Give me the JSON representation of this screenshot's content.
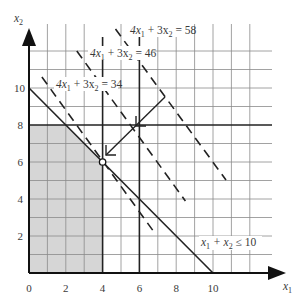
{
  "figure": {
    "type": "linear-programming-graphical-solution",
    "axes": {
      "x_label": "x",
      "x_label_sub": "1",
      "y_label": "x",
      "y_label_sub": "2",
      "x_ticks": [
        "0",
        "2",
        "4",
        "6",
        "8",
        "10"
      ],
      "y_ticks": [
        "2",
        "4",
        "6",
        "8",
        "10"
      ],
      "x_range": [
        0,
        13.2
      ],
      "y_range": [
        0,
        13.5
      ],
      "grid": true,
      "grid_step": 1
    },
    "feasible_region": {
      "vertices": [
        [
          0,
          0
        ],
        [
          0,
          8
        ],
        [
          2,
          8
        ],
        [
          4,
          6
        ],
        [
          4,
          0
        ]
      ],
      "fill": "#d6d6d6"
    },
    "constraints": [
      {
        "label": "x₁ + x₂ ≤ 10",
        "x_part": "x",
        "sub1": "1",
        "mid": " + x",
        "sub2": "2",
        "tail": " ≤ 10",
        "from": [
          0,
          10
        ],
        "to": [
          10,
          0
        ]
      },
      {
        "label": "x₁ ≤ 4",
        "from": [
          4,
          0
        ],
        "to": [
          4,
          12.8
        ]
      },
      {
        "label": "x₁ ≤ 6",
        "from": [
          6,
          0
        ],
        "to": [
          6,
          12.8
        ]
      },
      {
        "label": "x₂ ≤ 8",
        "from": [
          0,
          8
        ],
        "to": [
          13.2,
          8
        ]
      }
    ],
    "objective_lines": [
      {
        "value": 34,
        "prefix": "4x",
        "sub1": "1",
        "mid": " + 3x",
        "sub2": "2",
        "tail": " = 34",
        "from": [
          0.7,
          10.6
        ],
        "to": [
          6.8,
          2.2
        ]
      },
      {
        "value": 46,
        "prefix": "4x",
        "sub1": "1",
        "mid": " + 3x",
        "sub2": "2",
        "tail": " = 46",
        "from": [
          2.6,
          12.0
        ],
        "to": [
          8.5,
          3.9
        ]
      },
      {
        "value": 58,
        "prefix": "4x",
        "sub1": "1",
        "mid": " + 3x",
        "sub2": "2",
        "tail": " = 58",
        "from": [
          4.7,
          13.2
        ],
        "to": [
          10.7,
          5.0
        ]
      }
    ],
    "optimum": {
      "x1": 4,
      "x2": 6,
      "marker": "hollow-circle"
    },
    "direction_arrow": {
      "from": [
        7.4,
        9.4
      ],
      "to": [
        4.2,
        6.3
      ],
      "mid_arrowhead_at": [
        6.1,
        8.0
      ]
    }
  }
}
